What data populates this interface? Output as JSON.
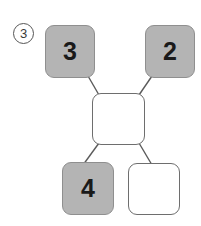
{
  "figure": {
    "marker": "3",
    "marker_shape": "circled-number",
    "background_color": "#ffffff"
  },
  "colors": {
    "filled_fill": "#b4b4b4",
    "filled_border": "#8f8f8f",
    "empty_fill": "#ffffff",
    "empty_border": "#6e6e6e",
    "digit_color": "#1a1a1a",
    "link_color": "#5a5a5a"
  },
  "nodes": [
    {
      "id": "top-left",
      "label": "3",
      "filled": true,
      "x": 45,
      "y": 25,
      "w": 50,
      "h": 53
    },
    {
      "id": "top-right",
      "label": "2",
      "filled": true,
      "x": 145,
      "y": 25,
      "w": 50,
      "h": 53
    },
    {
      "id": "center",
      "label": "",
      "filled": false,
      "x": 92,
      "y": 93,
      "w": 53,
      "h": 52
    },
    {
      "id": "bottom-left",
      "label": "4",
      "filled": true,
      "x": 62,
      "y": 162,
      "w": 52,
      "h": 53
    },
    {
      "id": "bottom-right",
      "label": "",
      "filled": false,
      "x": 128,
      "y": 163,
      "w": 52,
      "h": 52
    }
  ],
  "links": [
    {
      "from": "top-left",
      "to": "center",
      "x1": 88,
      "y1": 76,
      "x2": 99,
      "y2": 95
    },
    {
      "from": "top-right",
      "to": "center",
      "x1": 152,
      "y1": 76,
      "x2": 139,
      "y2": 95
    },
    {
      "from": "center",
      "to": "bottom-left",
      "x1": 99,
      "y1": 143,
      "x2": 83,
      "y2": 165
    },
    {
      "from": "center",
      "to": "bottom-right",
      "x1": 139,
      "y1": 143,
      "x2": 152,
      "y2": 165
    }
  ]
}
